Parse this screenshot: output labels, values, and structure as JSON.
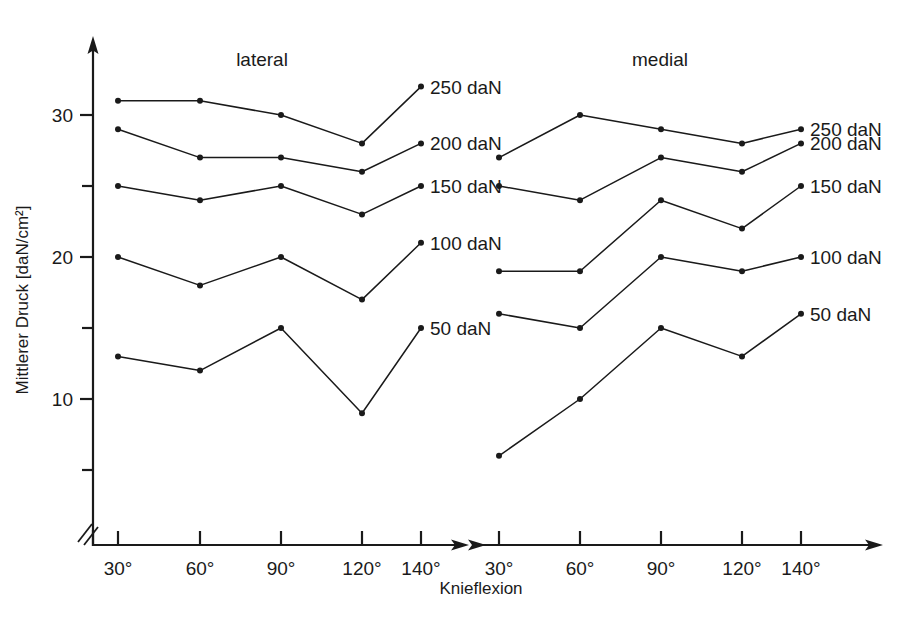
{
  "chart_data": {
    "type": "line",
    "title": "",
    "xlabel": "Knieflexion",
    "ylabel": "Mittlerer Druck [daN/cm²]",
    "categories": [
      "30°",
      "60°",
      "90°",
      "120°",
      "140°"
    ],
    "ylim": [
      3,
      33.5
    ],
    "yticks": [
      5,
      10,
      15,
      20,
      25,
      30
    ],
    "ytick_labels": [
      "",
      "10",
      "",
      "20",
      "",
      "30"
    ],
    "grid": false,
    "axis_break": true,
    "legend": "inline-right-of-each-panel",
    "line_color": "#1a1a1a",
    "marker_color": "#1a1a1a",
    "panels": [
      {
        "name": "lateral",
        "title": "lateral",
        "series": [
          {
            "name": "250 daN",
            "label": "250 daN",
            "values": [
              31,
              31,
              30,
              28,
              32
            ]
          },
          {
            "name": "200 daN",
            "label": "200 daN",
            "values": [
              29,
              27,
              27,
              26,
              28
            ]
          },
          {
            "name": "150 daN",
            "label": "150 daN",
            "values": [
              25,
              24,
              25,
              23,
              25
            ]
          },
          {
            "name": "100 daN",
            "label": "100 daN",
            "values": [
              20,
              18,
              20,
              17,
              21
            ]
          },
          {
            "name": "50 daN",
            "label": "50 daN",
            "values": [
              13,
              12,
              15,
              9,
              15
            ]
          }
        ]
      },
      {
        "name": "medial",
        "title": "medial",
        "series": [
          {
            "name": "250 daN",
            "label": "250 daN",
            "values": [
              27,
              30,
              29,
              28,
              29
            ]
          },
          {
            "name": "200 daN",
            "label": "200 daN",
            "values": [
              25,
              24,
              27,
              26,
              28
            ]
          },
          {
            "name": "150 daN",
            "label": "150 daN",
            "values": [
              19,
              19,
              24,
              22,
              25
            ]
          },
          {
            "name": "100 daN",
            "label": "100 daN",
            "values": [
              16,
              15,
              20,
              19,
              20
            ]
          },
          {
            "name": "50 daN",
            "label": "50 daN",
            "values": [
              6,
              10,
              15,
              13,
              16
            ]
          }
        ]
      }
    ]
  },
  "axes": {
    "y_title": "Mittlerer Druck [daN/cm²]",
    "x_title": "Knieflexion",
    "y_labels": [
      {
        "value": 30,
        "text": "30"
      },
      {
        "value": 20,
        "text": "20"
      },
      {
        "value": 10,
        "text": "10"
      }
    ],
    "x_labels_left": [
      "30°",
      "60°",
      "90°",
      "120°",
      "140°"
    ],
    "x_labels_right": [
      "30°",
      "60°",
      "90°",
      "120°",
      "140°"
    ]
  }
}
